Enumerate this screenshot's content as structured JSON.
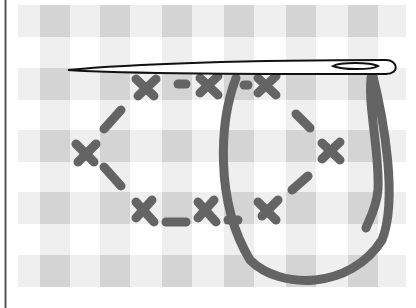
{
  "illustration": {
    "subject": "Cross-stitch on gingham fabric with threaded needle",
    "colors": {
      "background": "#ffffff",
      "gingham_light": "#f0f0f0",
      "gingham_mid": "#e4e4e4",
      "gingham_dark": "#d6d6d6",
      "thread": "#646464",
      "needle_outline": "#111111",
      "border": "#555555"
    }
  }
}
